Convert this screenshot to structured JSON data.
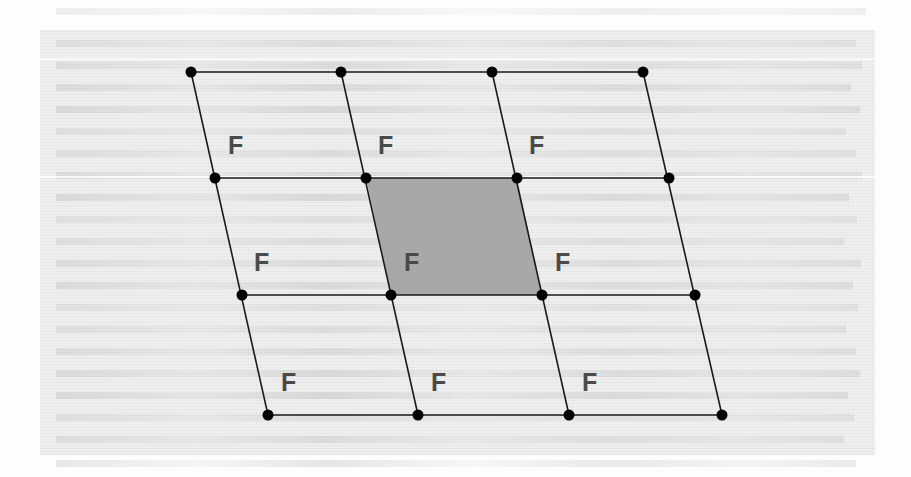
{
  "figure": {
    "background_color": "#eeeeee",
    "page_color": "#fdfdfd",
    "line_color": "#1a1a1a",
    "point_color": "#000000",
    "label_color": "#4a4a4a",
    "shaded_cell_color": "#a8a8a8",
    "label_text": "F",
    "grid": {
      "rows": 4,
      "cols": 4,
      "cells_rows": 3,
      "cells_cols": 3,
      "point_radius": 5.5,
      "line_width": 1.6,
      "points": [
        [
          {
            "x": 191,
            "y": 72
          },
          {
            "x": 341,
            "y": 72
          },
          {
            "x": 492,
            "y": 72
          },
          {
            "x": 643,
            "y": 72
          }
        ],
        [
          {
            "x": 215,
            "y": 178
          },
          {
            "x": 366,
            "y": 178
          },
          {
            "x": 517,
            "y": 178
          },
          {
            "x": 669,
            "y": 178
          }
        ],
        [
          {
            "x": 242,
            "y": 295
          },
          {
            "x": 391,
            "y": 295
          },
          {
            "x": 542,
            "y": 295
          },
          {
            "x": 695,
            "y": 295
          }
        ],
        [
          {
            "x": 268,
            "y": 415
          },
          {
            "x": 418,
            "y": 415
          },
          {
            "x": 569,
            "y": 415
          },
          {
            "x": 722,
            "y": 415
          }
        ]
      ],
      "shaded_cell": {
        "row": 1,
        "col": 1
      }
    },
    "labels": [
      {
        "text": "F",
        "x": 228,
        "y": 133
      },
      {
        "text": "F",
        "x": 378,
        "y": 133
      },
      {
        "text": "F",
        "x": 529,
        "y": 133
      },
      {
        "text": "F",
        "x": 254,
        "y": 250
      },
      {
        "text": "F",
        "x": 404,
        "y": 250
      },
      {
        "text": "F",
        "x": 555,
        "y": 250
      },
      {
        "text": "F",
        "x": 281,
        "y": 370
      },
      {
        "text": "F",
        "x": 431,
        "y": 370
      },
      {
        "text": "F",
        "x": 582,
        "y": 370
      }
    ],
    "ghost_lines": [
      {
        "x": 56,
        "y": 8,
        "w": 810
      },
      {
        "x": 56,
        "y": 40,
        "w": 800
      },
      {
        "x": 56,
        "y": 62,
        "w": 806
      },
      {
        "x": 56,
        "y": 84,
        "w": 795
      },
      {
        "x": 56,
        "y": 106,
        "w": 804
      },
      {
        "x": 56,
        "y": 128,
        "w": 790
      },
      {
        "x": 56,
        "y": 150,
        "w": 800
      },
      {
        "x": 56,
        "y": 172,
        "w": 806
      },
      {
        "x": 56,
        "y": 194,
        "w": 793
      },
      {
        "x": 56,
        "y": 216,
        "w": 801
      },
      {
        "x": 56,
        "y": 238,
        "w": 788
      },
      {
        "x": 56,
        "y": 260,
        "w": 805
      },
      {
        "x": 56,
        "y": 282,
        "w": 797
      },
      {
        "x": 56,
        "y": 304,
        "w": 802
      },
      {
        "x": 56,
        "y": 326,
        "w": 790
      },
      {
        "x": 56,
        "y": 348,
        "w": 800
      },
      {
        "x": 56,
        "y": 370,
        "w": 804
      },
      {
        "x": 56,
        "y": 392,
        "w": 792
      },
      {
        "x": 56,
        "y": 414,
        "w": 798
      },
      {
        "x": 56,
        "y": 436,
        "w": 788
      },
      {
        "x": 56,
        "y": 460,
        "w": 800
      }
    ],
    "scan_streaks": [
      {
        "y": 58
      },
      {
        "y": 176
      }
    ]
  }
}
